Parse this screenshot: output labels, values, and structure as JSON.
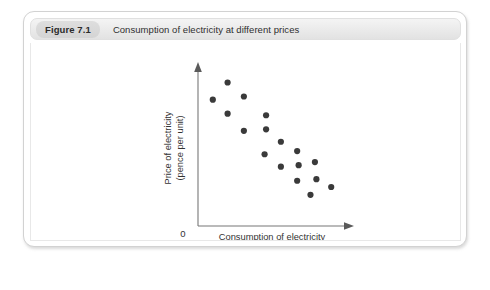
{
  "figure": {
    "number_label": "Figure 7.1",
    "title": "Consumption of electricity at different prices"
  },
  "chart_data": {
    "type": "scatter",
    "title": "Consumption of electricity at different prices",
    "xlabel_line1": "Consumption of electricity",
    "xlabel_line2": "(units)",
    "ylabel_line1": "Price of electricity",
    "ylabel_line2": "(pence per unit)",
    "origin_label": "0",
    "grid": false,
    "legend": "none",
    "xlim": [
      0,
      100
    ],
    "ylim": [
      0,
      100
    ],
    "axis_ticks": [],
    "point_color": "#3a3a3a",
    "axis_color": "#777777",
    "points": [
      {
        "x": 20,
        "y": 92
      },
      {
        "x": 10,
        "y": 81
      },
      {
        "x": 31,
        "y": 83
      },
      {
        "x": 20,
        "y": 72
      },
      {
        "x": 46,
        "y": 71
      },
      {
        "x": 31,
        "y": 61
      },
      {
        "x": 46,
        "y": 62
      },
      {
        "x": 56,
        "y": 54
      },
      {
        "x": 45,
        "y": 46
      },
      {
        "x": 67,
        "y": 48
      },
      {
        "x": 56,
        "y": 38
      },
      {
        "x": 68,
        "y": 39
      },
      {
        "x": 79,
        "y": 41
      },
      {
        "x": 67,
        "y": 29
      },
      {
        "x": 80,
        "y": 30
      },
      {
        "x": 76,
        "y": 20
      },
      {
        "x": 90,
        "y": 25
      }
    ]
  }
}
